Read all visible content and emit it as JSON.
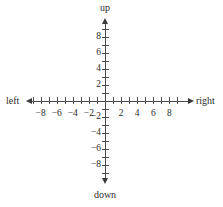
{
  "figure": {
    "title": "",
    "background_color": "#ffffff",
    "axis_color": "#4a4a4a",
    "text_color": "#2b2b2b"
  },
  "direction_labels": {
    "up": "up",
    "down": "down",
    "left": "left",
    "right": "right"
  },
  "chart_data": {
    "type": "scatter",
    "title": "",
    "subtitle": "",
    "xlabel": "",
    "ylabel": "",
    "xlim": [
      -9,
      9
    ],
    "ylim": [
      -9,
      9
    ],
    "grid": false,
    "legend": null,
    "series": [],
    "annotations": [
      "up",
      "down",
      "left",
      "right"
    ],
    "x_axis": {
      "direction_label_negative": "left",
      "direction_label_positive": "right",
      "tick_positions": [
        -9,
        -8,
        -7,
        -6,
        -5,
        -4,
        -3,
        -2,
        -1,
        1,
        2,
        3,
        4,
        5,
        6,
        7,
        8,
        9
      ],
      "labeled_ticks": [
        -8,
        -6,
        -4,
        -2,
        2,
        4,
        6,
        8
      ],
      "tick_labels": [
        "−8",
        "−6",
        "−4",
        "−2",
        "2",
        "4",
        "6",
        "8"
      ]
    },
    "y_axis": {
      "direction_label_negative": "down",
      "direction_label_positive": "up",
      "tick_positions": [
        -9,
        -8,
        -7,
        -6,
        -5,
        -4,
        -3,
        -2,
        -1,
        1,
        2,
        3,
        4,
        5,
        6,
        7,
        8,
        9
      ],
      "labeled_ticks": [
        8,
        6,
        4,
        2,
        -2,
        -4,
        -6,
        -8
      ],
      "tick_labels": [
        "8",
        "6",
        "4",
        "2",
        "−2",
        "−4",
        "−6",
        "−8"
      ]
    },
    "origin": [
      0,
      0
    ],
    "arrows": [
      "up",
      "down",
      "left",
      "right"
    ]
  }
}
